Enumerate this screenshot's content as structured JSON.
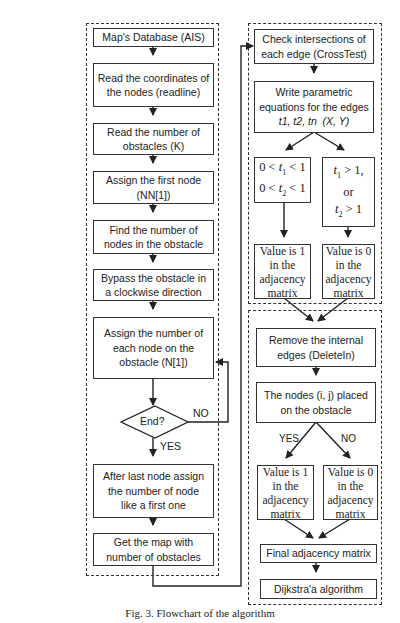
{
  "figure": {
    "caption": "Fig. 3. Flowchart of the algorithm",
    "left_column": {
      "steps": [
        "Map's Database (AIS)",
        "Read the coordinates of the nodes (readline)",
        "Read the number of obstacles (K)",
        "Assign the first node (NN[1])",
        "Find the number of nodes in the obstacle",
        "Bypass the obstacle in a clockwise direction",
        "Assign the number of each node on the obstacle (N[1])"
      ],
      "decision": {
        "label": "End?",
        "yes_label": "YES",
        "no_label": "NO"
      },
      "after_steps": [
        "After last node assign the number of node like a first one",
        "Get the map with number of obstacles"
      ]
    },
    "right_top": {
      "steps": [
        "Check intersections of each edge (CrossTest)",
        "Write parametric equations for the edges t1, t2, tn (X, Y)"
      ],
      "branch_left_condition": [
        "0 < t1 < 1",
        "0 < t2 < 1"
      ],
      "branch_right_condition": [
        "t1 > 1,",
        "or",
        "t2 > 1"
      ],
      "result_left": "Value is 1 in the adjacency matrix",
      "result_right": "Value is 0 in the adjacency matrix"
    },
    "right_bottom": {
      "steps": [
        "Remove the internal edges (DeleteIn)",
        "The nodes (i, j) placed on the obstacle"
      ],
      "yes_label": "YES",
      "no_label": "NO",
      "result_left": "Value is 1 in the adjacency matrix",
      "result_right": "Value is 0 in the adjacency matrix",
      "final_steps": [
        "Final adjacency matrix",
        "Dijkstra'a algorithm"
      ]
    }
  }
}
